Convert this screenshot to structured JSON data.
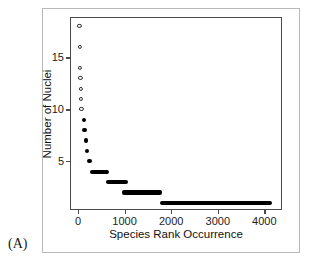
{
  "panel": {
    "label": "(A)"
  },
  "chart_data": {
    "type": "scatter",
    "title": "",
    "xlabel": "Species Rank Occurrence",
    "ylabel": "Number of Nuclei",
    "xlim": [
      -150,
      4400
    ],
    "ylim": [
      0.2,
      18.8
    ],
    "grid": false,
    "legend": null,
    "xticks": [
      0,
      1000,
      2000,
      3000,
      4000
    ],
    "xticklabels": [
      "0",
      "1000",
      "2000",
      "3000",
      "4000"
    ],
    "yticks": [
      5,
      10,
      15
    ],
    "yticklabels": [
      "5",
      "10",
      "15"
    ],
    "marker_styles": {
      "open": "unfilled circle (nuclei count 9 and above)",
      "filled": "solid horizontal bar of stacked points (nuclei count 8 and below)"
    },
    "points": [
      {
        "y": 18,
        "x_start": 30,
        "x_end": 30,
        "style": "open"
      },
      {
        "y": 16,
        "x_start": 38,
        "x_end": 38,
        "style": "open"
      },
      {
        "y": 14,
        "x_start": 45,
        "x_end": 45,
        "style": "open"
      },
      {
        "y": 13,
        "x_start": 52,
        "x_end": 52,
        "style": "open"
      },
      {
        "y": 12,
        "x_start": 58,
        "x_end": 58,
        "style": "open"
      },
      {
        "y": 11,
        "x_start": 66,
        "x_end": 66,
        "style": "open"
      },
      {
        "y": 10,
        "x_start": 74,
        "x_end": 74,
        "style": "open"
      },
      {
        "y": 9,
        "x_start": 85,
        "x_end": 95,
        "style": "filled"
      },
      {
        "y": 8,
        "x_start": 95,
        "x_end": 115,
        "style": "filled"
      },
      {
        "y": 7,
        "x_start": 120,
        "x_end": 150,
        "style": "filled"
      },
      {
        "y": 6,
        "x_start": 150,
        "x_end": 215,
        "style": "filled"
      },
      {
        "y": 5,
        "x_start": 195,
        "x_end": 300,
        "style": "filled"
      },
      {
        "y": 4,
        "x_start": 255,
        "x_end": 665,
        "style": "filled"
      },
      {
        "y": 3,
        "x_start": 600,
        "x_end": 1080,
        "style": "filled"
      },
      {
        "y": 2,
        "x_start": 935,
        "x_end": 1800,
        "style": "filled"
      },
      {
        "y": 1,
        "x_start": 1755,
        "x_end": 4160,
        "style": "filled"
      }
    ]
  }
}
